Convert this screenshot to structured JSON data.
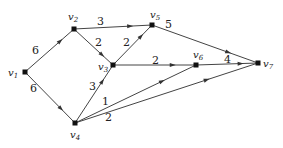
{
  "graph": {
    "type": "directed-weighted",
    "nodes": [
      {
        "id": "v1",
        "label": "v1",
        "x": 25,
        "y": 72,
        "lx": 8,
        "ly": 76
      },
      {
        "id": "v2",
        "label": "v2",
        "x": 74,
        "y": 29,
        "lx": 68,
        "ly": 20
      },
      {
        "id": "v3",
        "label": "v3",
        "x": 113,
        "y": 65,
        "lx": 98,
        "ly": 70
      },
      {
        "id": "v4",
        "label": "v4",
        "x": 75,
        "y": 123,
        "lx": 70,
        "ly": 138
      },
      {
        "id": "v5",
        "label": "v5",
        "x": 152,
        "y": 25,
        "lx": 150,
        "ly": 18
      },
      {
        "id": "v6",
        "label": "v6",
        "x": 196,
        "y": 65,
        "lx": 193,
        "ly": 58
      },
      {
        "id": "v7",
        "label": "v7",
        "x": 258,
        "y": 63,
        "lx": 263,
        "ly": 67
      }
    ],
    "edges": [
      {
        "from": "v1",
        "to": "v2",
        "weight": "6",
        "wx": 32,
        "wy": 54
      },
      {
        "from": "v1",
        "to": "v4",
        "weight": "6",
        "wx": 30,
        "wy": 92
      },
      {
        "from": "v2",
        "to": "v5",
        "weight": "3",
        "wx": 97,
        "wy": 25
      },
      {
        "from": "v2",
        "to": "v3",
        "weight": "2",
        "wx": 95,
        "wy": 46
      },
      {
        "from": "v3",
        "to": "v5",
        "weight": "2",
        "wx": 123,
        "wy": 46
      },
      {
        "from": "v3",
        "to": "v6",
        "weight": "2",
        "wx": 152,
        "wy": 64
      },
      {
        "from": "v4",
        "to": "v3",
        "weight": "3",
        "wx": 89,
        "wy": 90
      },
      {
        "from": "v4",
        "to": "v6",
        "weight": "1",
        "wx": 102,
        "wy": 105
      },
      {
        "from": "v4",
        "to": "v7",
        "weight": "2",
        "wx": 105,
        "wy": 121
      },
      {
        "from": "v5",
        "to": "v7",
        "weight": "5",
        "wx": 165,
        "wy": 28
      },
      {
        "from": "v6",
        "to": "v7",
        "weight": "4",
        "wx": 224,
        "wy": 63
      }
    ]
  }
}
